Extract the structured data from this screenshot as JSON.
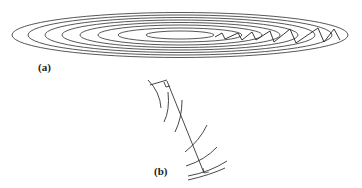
{
  "figure": {
    "panel_a": {
      "label": "(a)",
      "center": [
        180,
        35
      ],
      "ellipses": [
        {
          "rx": 34,
          "ry": 4
        },
        {
          "rx": 62,
          "ry": 7
        },
        {
          "rx": 82,
          "ry": 10
        },
        {
          "rx": 100,
          "ry": 12.5
        },
        {
          "rx": 118,
          "ry": 15
        },
        {
          "rx": 135,
          "ry": 17.5
        },
        {
          "rx": 152,
          "ry": 20
        },
        {
          "rx": 168,
          "ry": 22.5
        }
      ],
      "zigzag_path": [
        [
          215,
          37
        ],
        [
          222,
          33
        ],
        [
          225,
          39
        ],
        [
          238,
          33
        ],
        [
          242,
          40
        ],
        [
          252,
          32
        ],
        [
          256,
          40
        ],
        [
          270,
          31
        ],
        [
          274,
          42
        ],
        [
          290,
          29
        ],
        [
          296,
          43
        ],
        [
          318,
          28
        ],
        [
          324,
          42
        ],
        [
          334,
          29
        ],
        [
          340,
          40
        ]
      ],
      "stroke_color": "#333333"
    },
    "panel_b": {
      "label": "(b)"
    }
  }
}
